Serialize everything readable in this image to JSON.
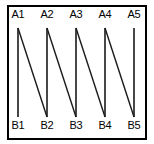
{
  "figure": {
    "title": "",
    "type": "zigzag-line-diagram",
    "frame": {
      "border_color": "#000000",
      "border_width": 2,
      "background": "#ffffff"
    },
    "line_color": "#1a1a1a",
    "label_color": "#000000"
  },
  "chart_data": {
    "type": "line",
    "title": "",
    "xlabel": "",
    "ylabel": "",
    "grid": false,
    "legend": null,
    "top_nodes": [
      "A1",
      "A2",
      "A3",
      "A4",
      "A5"
    ],
    "bottom_nodes": [
      "B1",
      "B2",
      "B3",
      "B4",
      "B5"
    ],
    "top_node_x": [
      18,
      47,
      76,
      105,
      134
    ],
    "bottom_node_x": [
      18,
      47,
      76,
      105,
      134
    ],
    "top_y": 28,
    "bottom_y": 117,
    "segments": [
      {
        "from": "A1",
        "to": "B1",
        "kind": "vertical"
      },
      {
        "from": "A2",
        "to": "B2",
        "kind": "vertical"
      },
      {
        "from": "A3",
        "to": "B3",
        "kind": "vertical"
      },
      {
        "from": "A4",
        "to": "B4",
        "kind": "vertical"
      },
      {
        "from": "A5",
        "to": "B5",
        "kind": "vertical"
      },
      {
        "from": "A1",
        "to": "B2",
        "kind": "diagonal"
      },
      {
        "from": "A2",
        "to": "B3",
        "kind": "diagonal"
      },
      {
        "from": "A3",
        "to": "B4",
        "kind": "diagonal"
      },
      {
        "from": "A4",
        "to": "B5",
        "kind": "diagonal"
      }
    ]
  },
  "labels": {
    "top": [
      {
        "text": "A1",
        "x": 18
      },
      {
        "text": "A2",
        "x": 47
      },
      {
        "text": "A3",
        "x": 76
      },
      {
        "text": "A4",
        "x": 105
      },
      {
        "text": "A5",
        "x": 134
      }
    ],
    "bottom": [
      {
        "text": "B1",
        "x": 18
      },
      {
        "text": "B2",
        "x": 47
      },
      {
        "text": "B3",
        "x": 76
      },
      {
        "text": "B4",
        "x": 105
      },
      {
        "text": "B5",
        "x": 134
      }
    ]
  }
}
